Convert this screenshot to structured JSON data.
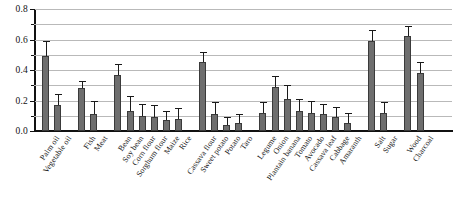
{
  "chart_data": {
    "type": "bar",
    "title": "",
    "xlabel": "",
    "ylabel": "",
    "ylim": [
      0,
      0.8
    ],
    "ytick_labels": [
      "0.0",
      "0.2",
      "0.4",
      "0.6",
      "0.8"
    ],
    "ytick_values": [
      0.0,
      0.2,
      0.4,
      0.6,
      0.8
    ],
    "gridlines": [
      0.1,
      0.2,
      0.3,
      0.4,
      0.5,
      0.6,
      0.7,
      0.8
    ],
    "grid": true,
    "legend": "none",
    "error_bars": "upper",
    "bar_color": "#6e6e6e",
    "bar_edge_color": "#3a3a3a",
    "grid_color": "#b9b9b9",
    "axis_color": "#111111",
    "categories": [
      "Palm oil",
      "Vegetable oil",
      "Fish",
      "Meat",
      "Bean",
      "Soy bean",
      "Corn flour",
      "Sorghum flour",
      "Maize",
      "Rice",
      "Cassava flour",
      "Sweet potato",
      "Potato",
      "Taro",
      "Legume",
      "Onion",
      "Plantain banana",
      "Tomato",
      "Avocado",
      "Cassava leaf",
      "Cabbage",
      "Amaranth",
      "Salt",
      "Sugar",
      "Wood",
      "Charcoal"
    ],
    "values": [
      0.49,
      0.17,
      0.28,
      0.11,
      0.37,
      0.13,
      0.1,
      0.09,
      0.07,
      0.08,
      0.45,
      0.11,
      0.04,
      0.05,
      0.12,
      0.29,
      0.21,
      0.13,
      0.12,
      0.11,
      0.09,
      0.05,
      0.59,
      0.12,
      0.62,
      0.38
    ],
    "errors": [
      0.1,
      0.07,
      0.05,
      0.09,
      0.07,
      0.1,
      0.08,
      0.08,
      0.06,
      0.07,
      0.07,
      0.08,
      0.05,
      0.06,
      0.07,
      0.07,
      0.09,
      0.08,
      0.08,
      0.07,
      0.07,
      0.07,
      0.07,
      0.07,
      0.07,
      0.07
    ],
    "group_breaks": [
      2,
      4,
      10,
      14,
      22,
      24
    ]
  }
}
